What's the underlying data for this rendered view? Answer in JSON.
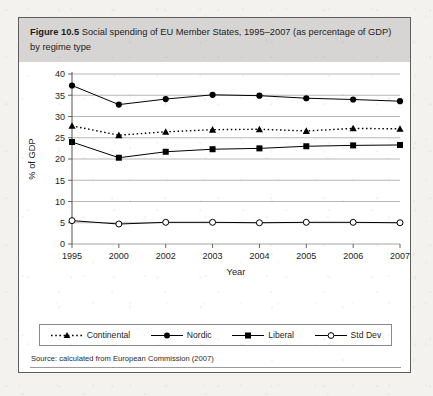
{
  "figure": {
    "label": "Figure 10.5",
    "caption": "Social spending of EU Member States, 1995–2007 (as percentage of GDP) by regime type",
    "source": "Source: calculated from European Commission (2007)"
  },
  "chart_data": {
    "type": "line",
    "title": "Social spending of EU Member States, 1995–2007 (as percentage of GDP) by regime type",
    "xlabel": "Year",
    "ylabel": "% of GDP",
    "categories": [
      "1995",
      "2000",
      "2002",
      "2003",
      "2004",
      "2005",
      "2006",
      "2007"
    ],
    "ylim": [
      0,
      40
    ],
    "yticks": [
      0,
      5,
      10,
      15,
      20,
      25,
      30,
      35,
      40
    ],
    "grid": true,
    "legend_position": "below",
    "series": [
      {
        "name": "Continental",
        "marker": "triangle",
        "line": "dotted",
        "color": "#000000",
        "values": [
          27.8,
          25.6,
          26.4,
          26.9,
          27.0,
          26.6,
          27.2,
          27.1
        ]
      },
      {
        "name": "Nordic",
        "marker": "circle-filled",
        "line": "solid",
        "color": "#000000",
        "values": [
          37.3,
          32.8,
          34.1,
          35.1,
          34.9,
          34.3,
          34.0,
          33.6
        ]
      },
      {
        "name": "Liberal",
        "marker": "square-filled",
        "line": "solid",
        "color": "#000000",
        "values": [
          24.0,
          20.3,
          21.7,
          22.3,
          22.5,
          23.0,
          23.2,
          23.3
        ]
      },
      {
        "name": "Std Dev",
        "marker": "circle-open",
        "line": "solid",
        "color": "#000000",
        "values": [
          5.5,
          4.7,
          5.1,
          5.1,
          5.0,
          5.1,
          5.1,
          5.0
        ]
      }
    ]
  },
  "legend": {
    "items": [
      {
        "label": "Continental"
      },
      {
        "label": "Nordic"
      },
      {
        "label": "Liberal"
      },
      {
        "label": "Std Dev"
      }
    ]
  }
}
